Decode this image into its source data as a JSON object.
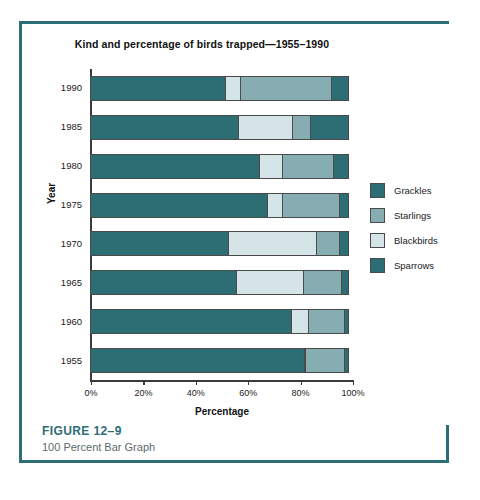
{
  "chart_data": {
    "type": "bar",
    "orientation": "horizontal",
    "stacked": true,
    "normalized": "100 percent",
    "title": "Kind and percentage of birds trapped—1955–1990",
    "xlabel": "Percentage",
    "ylabel": "Year",
    "xlim": [
      0,
      100
    ],
    "xticks": [
      "0%",
      "20%",
      "40%",
      "60%",
      "80%",
      "100%"
    ],
    "xtick_values": [
      0,
      20,
      40,
      60,
      80,
      100
    ],
    "grid": false,
    "legend_position": "right",
    "categories": [
      "1990",
      "1985",
      "1980",
      "1975",
      "1970",
      "1965",
      "1960",
      "1955"
    ],
    "series": [
      {
        "name": "Grackles",
        "color": "#2d6e75",
        "values": [
          52,
          57,
          65,
          68,
          53,
          56,
          77,
          82
        ]
      },
      {
        "name": "Starlings",
        "color": "#86aeb2",
        "values": [
          35,
          7,
          20,
          22,
          9,
          15,
          14,
          15
        ]
      },
      {
        "name": "Blackbirds",
        "color": "#d4e4e7",
        "values": [
          6,
          21,
          9,
          6,
          34,
          26,
          7,
          1
        ]
      },
      {
        "name": "Sparrows",
        "color": "#2d6e75",
        "values": [
          7,
          15,
          6,
          4,
          4,
          3,
          2,
          2
        ]
      }
    ],
    "segment_order": [
      "Grackles",
      "Blackbirds",
      "Starlings",
      "Sparrows"
    ],
    "rows": [
      {
        "year": "1990",
        "segments": [
          {
            "name": "Grackles",
            "value": 52,
            "color": "#2d6e75"
          },
          {
            "name": "Blackbirds",
            "value": 6,
            "color": "#d4e4e7"
          },
          {
            "name": "Starlings",
            "value": 35,
            "color": "#86aeb2"
          },
          {
            "name": "Sparrows",
            "value": 7,
            "color": "#2d6e75"
          }
        ]
      },
      {
        "year": "1985",
        "segments": [
          {
            "name": "Grackles",
            "value": 57,
            "color": "#2d6e75"
          },
          {
            "name": "Blackbirds",
            "value": 21,
            "color": "#d4e4e7"
          },
          {
            "name": "Starlings",
            "value": 7,
            "color": "#86aeb2"
          },
          {
            "name": "Sparrows",
            "value": 15,
            "color": "#2d6e75"
          }
        ]
      },
      {
        "year": "1980",
        "segments": [
          {
            "name": "Grackles",
            "value": 65,
            "color": "#2d6e75"
          },
          {
            "name": "Blackbirds",
            "value": 9,
            "color": "#d4e4e7"
          },
          {
            "name": "Starlings",
            "value": 20,
            "color": "#86aeb2"
          },
          {
            "name": "Sparrows",
            "value": 6,
            "color": "#2d6e75"
          }
        ]
      },
      {
        "year": "1975",
        "segments": [
          {
            "name": "Grackles",
            "value": 68,
            "color": "#2d6e75"
          },
          {
            "name": "Blackbirds",
            "value": 6,
            "color": "#d4e4e7"
          },
          {
            "name": "Starlings",
            "value": 22,
            "color": "#86aeb2"
          },
          {
            "name": "Sparrows",
            "value": 4,
            "color": "#2d6e75"
          }
        ]
      },
      {
        "year": "1970",
        "segments": [
          {
            "name": "Grackles",
            "value": 53,
            "color": "#2d6e75"
          },
          {
            "name": "Blackbirds",
            "value": 34,
            "color": "#d4e4e7"
          },
          {
            "name": "Starlings",
            "value": 9,
            "color": "#86aeb2"
          },
          {
            "name": "Sparrows",
            "value": 4,
            "color": "#2d6e75"
          }
        ]
      },
      {
        "year": "1965",
        "segments": [
          {
            "name": "Grackles",
            "value": 56,
            "color": "#2d6e75"
          },
          {
            "name": "Blackbirds",
            "value": 26,
            "color": "#d4e4e7"
          },
          {
            "name": "Starlings",
            "value": 15,
            "color": "#86aeb2"
          },
          {
            "name": "Sparrows",
            "value": 3,
            "color": "#2d6e75"
          }
        ]
      },
      {
        "year": "1960",
        "segments": [
          {
            "name": "Grackles",
            "value": 77,
            "color": "#2d6e75"
          },
          {
            "name": "Blackbirds",
            "value": 7,
            "color": "#d4e4e7"
          },
          {
            "name": "Starlings",
            "value": 14,
            "color": "#86aeb2"
          },
          {
            "name": "Sparrows",
            "value": 2,
            "color": "#2d6e75"
          }
        ]
      },
      {
        "year": "1955",
        "segments": [
          {
            "name": "Grackles",
            "value": 82,
            "color": "#2d6e75"
          },
          {
            "name": "Blackbirds",
            "value": 1,
            "color": "#d4e4e7"
          },
          {
            "name": "Starlings",
            "value": 15,
            "color": "#86aeb2"
          },
          {
            "name": "Sparrows",
            "value": 2,
            "color": "#2d6e75"
          }
        ]
      }
    ],
    "legend": [
      {
        "label": "Grackles",
        "color": "#2d6e75"
      },
      {
        "label": "Starlings",
        "color": "#86aeb2"
      },
      {
        "label": "Blackbirds",
        "color": "#d4e4e7"
      },
      {
        "label": "Sparrows",
        "color": "#2d6e75"
      }
    ]
  },
  "caption": {
    "figure_number": "FIGURE 12–9",
    "figure_title": "100 Percent Bar Graph"
  },
  "theme": {
    "rule_color": "#2d6e75",
    "figure_number_color": "#2d6e75",
    "caption_color": "#5c6a6c",
    "axis_color": "#3a3a3a",
    "background": "#ffffff"
  }
}
